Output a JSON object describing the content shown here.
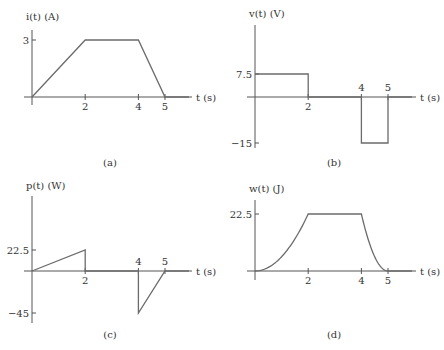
{
  "chart_data": [
    {
      "id": "a",
      "type": "line",
      "title": "",
      "caption": "(a)",
      "ylabel": "i(t) (A)",
      "xlabel": "t (s)",
      "x_ticks": [
        2,
        4,
        5
      ],
      "x_tick_labels": [
        "2",
        "4",
        "5"
      ],
      "y_ticks": [
        3
      ],
      "y_tick_labels": [
        "3"
      ],
      "xlim": [
        0,
        6
      ],
      "ylim": [
        0,
        3.5
      ],
      "series": [
        {
          "name": "i(t)",
          "x": [
            0,
            2,
            4,
            5,
            5.9
          ],
          "y": [
            0,
            3,
            3,
            0,
            0
          ],
          "shape": "linear"
        }
      ]
    },
    {
      "id": "b",
      "type": "line",
      "title": "",
      "caption": "(b)",
      "ylabel": "v(t) (V)",
      "xlabel": "t (s)",
      "x_ticks": [
        2,
        4,
        5
      ],
      "x_tick_labels": [
        "2",
        "4",
        "5"
      ],
      "y_ticks": [
        7.5,
        -15
      ],
      "y_tick_labels": [
        "7.5",
        "−15"
      ],
      "xlim": [
        0,
        6
      ],
      "ylim": [
        -18,
        20
      ],
      "series": [
        {
          "name": "v(t)",
          "x": [
            0,
            2,
            2,
            4,
            4,
            5,
            5,
            5.9
          ],
          "y": [
            7.5,
            7.5,
            0,
            0,
            -15,
            -15,
            0,
            0
          ],
          "shape": "step"
        }
      ]
    },
    {
      "id": "c",
      "type": "line",
      "title": "",
      "caption": "(c)",
      "ylabel": "p(t) (W)",
      "xlabel": "t (s)",
      "x_ticks": [
        2,
        4,
        5
      ],
      "x_tick_labels": [
        "2",
        "4",
        "5"
      ],
      "y_ticks": [
        22.5,
        -45
      ],
      "y_tick_labels": [
        "22.5",
        "−45"
      ],
      "xlim": [
        0,
        6
      ],
      "ylim": [
        -54,
        80
      ],
      "series": [
        {
          "name": "p(t)",
          "x": [
            0,
            2,
            2,
            4,
            4,
            5,
            5.9
          ],
          "y": [
            0,
            22.5,
            0,
            0,
            -45,
            0,
            0
          ],
          "shape": "linear"
        }
      ]
    },
    {
      "id": "d",
      "type": "line",
      "title": "",
      "caption": "(d)",
      "ylabel": "w(t) (J)",
      "xlabel": "t (s)",
      "x_ticks": [
        2,
        4,
        5
      ],
      "x_tick_labels": [
        "2",
        "4",
        "5"
      ],
      "y_ticks": [
        22.5
      ],
      "y_tick_labels": [
        "22.5"
      ],
      "xlim": [
        0,
        6
      ],
      "ylim": [
        0,
        27
      ],
      "series": [
        {
          "name": "w(t)",
          "segments": [
            {
              "from": 0,
              "to": 2,
              "formula": "22.5*(t/2)^2"
            },
            {
              "from": 2,
              "to": 4,
              "formula": "22.5"
            },
            {
              "from": 4,
              "to": 5,
              "formula": "22.5*(5-t)^2"
            },
            {
              "from": 5,
              "to": 5.9,
              "formula": "0"
            }
          ]
        }
      ]
    }
  ]
}
